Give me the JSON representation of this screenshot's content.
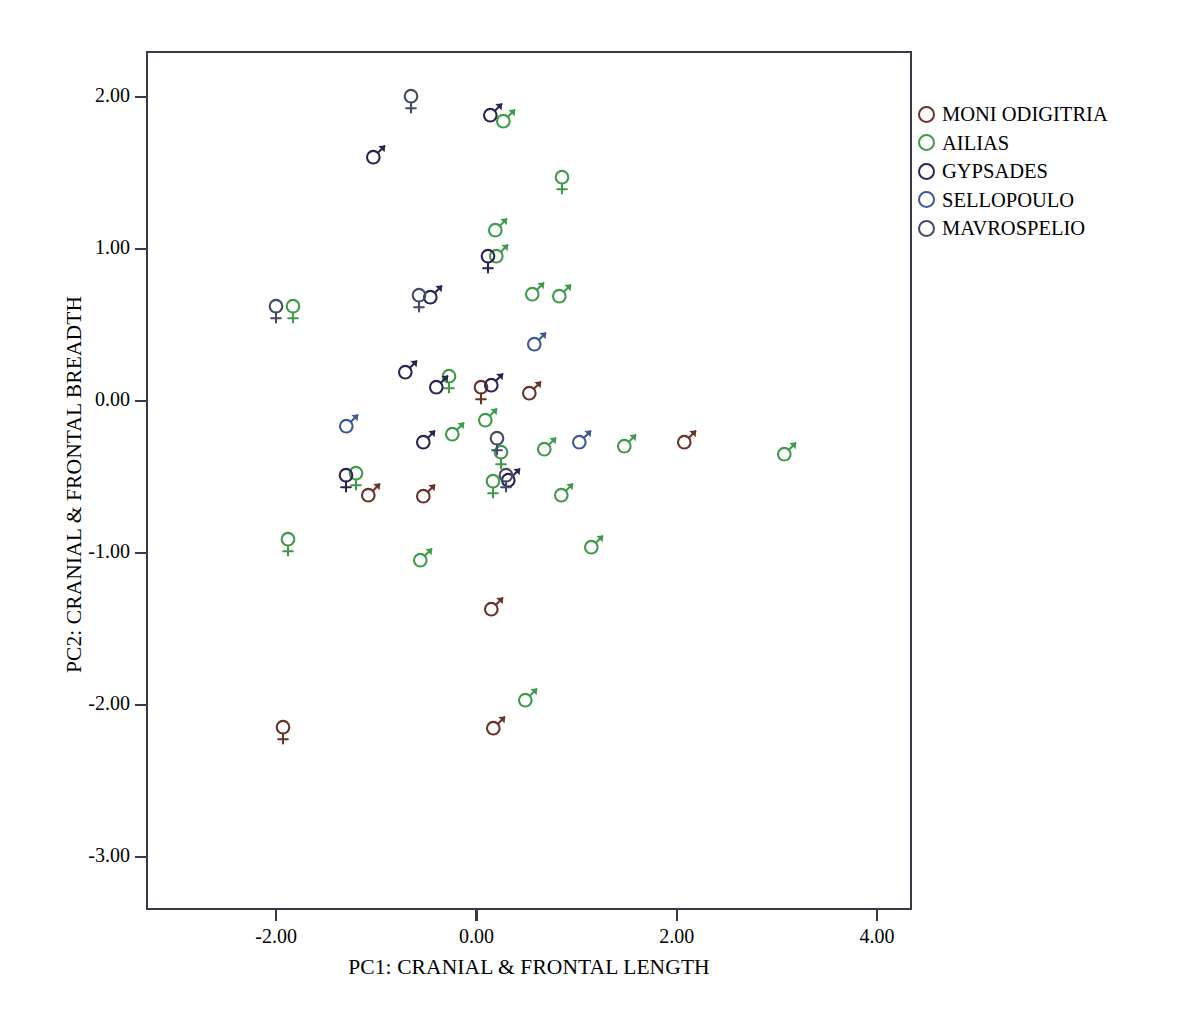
{
  "chart_data": {
    "type": "scatter",
    "title": "",
    "xlabel": "PC1: CRANIAL & FRONTAL LENGTH",
    "ylabel": "PC2: CRANIAL & FRONTAL BREADTH",
    "xlim": [
      -3.3,
      4.35
    ],
    "ylim": [
      -3.35,
      2.3
    ],
    "xticks": [
      "-2.00",
      "0.00",
      "2.00",
      "4.00"
    ],
    "xtick_values": [
      -2,
      0,
      2,
      4
    ],
    "yticks": [
      "2.00",
      "1.00",
      "0.00",
      "-1.00",
      "-2.00",
      "-3.00"
    ],
    "ytick_values": [
      2,
      1,
      0,
      -1,
      -2,
      -3
    ],
    "grid": false,
    "legend_position": "right",
    "marker_shapes": {
      "male": "mars-symbol",
      "female": "venus-symbol"
    },
    "series": [
      {
        "name": "MONI ODIGITRIA",
        "color": "#6b3228",
        "points": [
          {
            "x": 0.05,
            "y": 0.06,
            "sex": "female"
          },
          {
            "x": 0.55,
            "y": 0.07,
            "sex": "male"
          },
          {
            "x": 2.1,
            "y": -0.25,
            "sex": "male"
          },
          {
            "x": -1.05,
            "y": -0.6,
            "sex": "male"
          },
          {
            "x": -0.5,
            "y": -0.61,
            "sex": "male"
          },
          {
            "x": 0.18,
            "y": -1.35,
            "sex": "male"
          },
          {
            "x": 0.2,
            "y": -2.13,
            "sex": "male"
          },
          {
            "x": -1.93,
            "y": -2.18,
            "sex": "female"
          }
        ]
      },
      {
        "name": "AILIAS",
        "color": "#3f9b4a",
        "points": [
          {
            "x": 0.3,
            "y": 1.86,
            "sex": "male"
          },
          {
            "x": 0.85,
            "y": 1.44,
            "sex": "female"
          },
          {
            "x": 0.22,
            "y": 1.14,
            "sex": "male"
          },
          {
            "x": 0.23,
            "y": 0.97,
            "sex": "male"
          },
          {
            "x": 0.58,
            "y": 0.72,
            "sex": "male"
          },
          {
            "x": 0.85,
            "y": 0.71,
            "sex": "male"
          },
          {
            "x": -1.83,
            "y": 0.59,
            "sex": "female"
          },
          {
            "x": -0.27,
            "y": 0.13,
            "sex": "female"
          },
          {
            "x": 0.12,
            "y": -0.11,
            "sex": "male"
          },
          {
            "x": -0.21,
            "y": -0.2,
            "sex": "male"
          },
          {
            "x": 0.7,
            "y": -0.3,
            "sex": "male"
          },
          {
            "x": 1.5,
            "y": -0.28,
            "sex": "male"
          },
          {
            "x": 3.1,
            "y": -0.33,
            "sex": "male"
          },
          {
            "x": 0.25,
            "y": -0.37,
            "sex": "female"
          },
          {
            "x": -1.2,
            "y": -0.51,
            "sex": "female"
          },
          {
            "x": 0.17,
            "y": -0.56,
            "sex": "female"
          },
          {
            "x": 0.87,
            "y": -0.6,
            "sex": "male"
          },
          {
            "x": -1.88,
            "y": -0.94,
            "sex": "female"
          },
          {
            "x": -0.53,
            "y": -1.03,
            "sex": "male"
          },
          {
            "x": 1.17,
            "y": -0.94,
            "sex": "male"
          },
          {
            "x": 0.52,
            "y": -1.95,
            "sex": "male"
          }
        ]
      },
      {
        "name": "GYPSADES",
        "color": "#2b2452",
        "points": [
          {
            "x": 0.17,
            "y": 1.9,
            "sex": "male"
          },
          {
            "x": -1.0,
            "y": 1.62,
            "sex": "male"
          },
          {
            "x": 0.12,
            "y": 0.92,
            "sex": "female"
          },
          {
            "x": -0.43,
            "y": 0.7,
            "sex": "male"
          },
          {
            "x": 0.18,
            "y": 0.12,
            "sex": "male"
          },
          {
            "x": -0.68,
            "y": 0.21,
            "sex": "male"
          },
          {
            "x": -0.37,
            "y": 0.11,
            "sex": "male"
          },
          {
            "x": -0.5,
            "y": -0.25,
            "sex": "male"
          },
          {
            "x": 0.35,
            "y": -0.5,
            "sex": "male"
          },
          {
            "x": -1.3,
            "y": -0.52,
            "sex": "female"
          }
        ]
      },
      {
        "name": "SELLOPOULO",
        "color": "#3d5a96",
        "points": [
          {
            "x": 0.6,
            "y": 0.39,
            "sex": "male"
          },
          {
            "x": 1.05,
            "y": -0.25,
            "sex": "male"
          },
          {
            "x": -1.27,
            "y": -0.15,
            "sex": "male"
          }
        ]
      },
      {
        "name": "MAVROSPELIO",
        "color": "#454a68",
        "points": [
          {
            "x": -0.65,
            "y": 1.97,
            "sex": "female"
          },
          {
            "x": -0.57,
            "y": 0.66,
            "sex": "female"
          },
          {
            "x": -2.0,
            "y": 0.59,
            "sex": "female"
          },
          {
            "x": 0.21,
            "y": -0.28,
            "sex": "female"
          },
          {
            "x": 0.3,
            "y": -0.52,
            "sex": "female"
          }
        ]
      }
    ]
  },
  "legend": {
    "entries": [
      {
        "label": "MONI ODIGITRIA",
        "color": "#6b3228"
      },
      {
        "label": "AILIAS",
        "color": "#3f9b4a"
      },
      {
        "label": "GYPSADES",
        "color": "#2b2452"
      },
      {
        "label": "SELLOPOULO",
        "color": "#3d5a96"
      },
      {
        "label": "MAVROSPELIO",
        "color": "#454a68"
      }
    ]
  },
  "axes": {
    "x_title": "PC1: CRANIAL & FRONTAL LENGTH",
    "y_title": "PC2: CRANIAL & FRONTAL BREADTH"
  }
}
